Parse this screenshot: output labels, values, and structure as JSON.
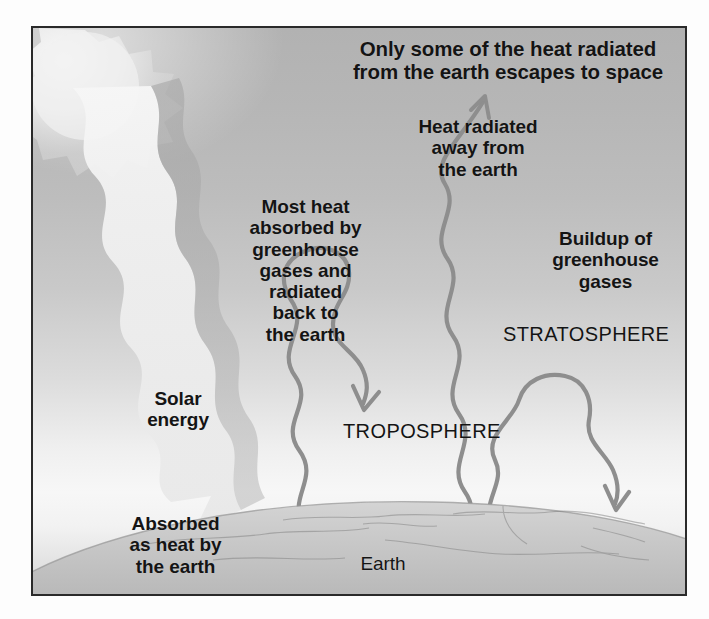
{
  "figure": {
    "title_caption": "Greenhouse effect diagram",
    "border_color": "#2a2a2a",
    "sky_top_color": "#b2b2b2",
    "sky_horizon_color": "#f7f7f7",
    "earth_color": "#cfcfcf",
    "arrow_color": "#8e8e8e",
    "sun_color": "#ececec",
    "beam_color": "#f2f2f2"
  },
  "labels": {
    "escape_to_space": "Only some of the heat radiated\nfrom the earth escapes to space",
    "heat_radiated_away": "Heat radiated\naway from\nthe earth",
    "most_heat_absorbed": "Most heat\nabsorbed by\ngreenhouse\ngases and\nradiated\nback to\nthe earth",
    "buildup_of_gases": "Buildup of\ngreenhouse\ngases",
    "stratosphere": "STRATOSPHERE",
    "solar_energy": "Solar\nenergy",
    "troposphere": "TROPOSPHERE",
    "absorbed_as_heat": "Absorbed\nas heat by\nthe earth",
    "earth": "Earth"
  },
  "elements": {
    "sun": "sun",
    "solar_beam": "solar-energy-beam",
    "arrow_escaping": "heat-escaping-arrow",
    "arrow_reradiated": "heat-reradiated-downward-arrow",
    "arrow_trapped": "heat-trapped-arrow",
    "earth_surface": "earth-surface"
  }
}
